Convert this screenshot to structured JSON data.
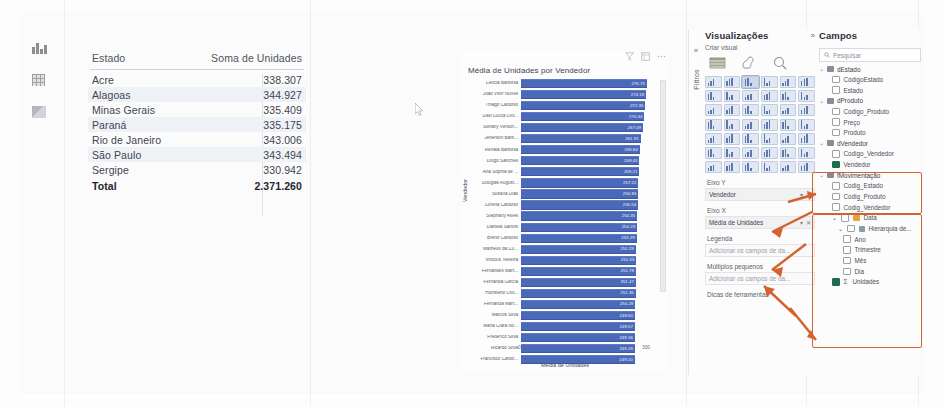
{
  "app": {
    "left_rail_icons": [
      "report-view-icon",
      "data-view-icon",
      "model-view-icon"
    ]
  },
  "table_visual": {
    "columns": [
      "Estado",
      "Soma de Unidades"
    ],
    "rows": [
      {
        "estado": "Acre",
        "valor": "338.307"
      },
      {
        "estado": "Alagoas",
        "valor": "344.927"
      },
      {
        "estado": "Minas Gerais",
        "valor": "335.409"
      },
      {
        "estado": "Paraná",
        "valor": "335.175"
      },
      {
        "estado": "Rio de Janeiro",
        "valor": "343.006"
      },
      {
        "estado": "São Paulo",
        "valor": "343.494"
      },
      {
        "estado": "Sergipe",
        "valor": "330.942"
      }
    ],
    "total_label": "Total",
    "total_value": "2.371.260"
  },
  "chart_data": {
    "type": "bar",
    "orientation": "horizontal",
    "title": "Média de Unidades por Vendedor",
    "xlabel": "Média de Unidades",
    "ylabel": "Vendedor",
    "xlim": [
      0,
      300
    ],
    "xticks": [
      "0",
      "300"
    ],
    "grid": false,
    "legend": "none",
    "bar_color": "#4a69b8",
    "categories": [
      "Letícia Barbosa",
      "João Vitor Nunes",
      "Thiago Cardoso",
      "Davi Lucca Oliv...",
      "Stefany Venturi...",
      "Jefferson Barb...",
      "Renata Barbosa",
      "Diogo Sanches",
      "Ana Sophia de ...",
      "Douglas August...",
      "Susana Dias",
      "Lorena Cardoso",
      "Stephany Alves",
      "Daniela Santos",
      "Breno Cardoso",
      "Matheus da Cu...",
      "Vinicius Teixeira",
      "Fernandes Mart...",
      "Fernanda Garcia",
      "Humberto Oliv...",
      "Fernanda Mart...",
      "Marcos Silva",
      "Maria Clara No...",
      "Frederico Silva",
      "Ricardo Silva",
      "Francisco Cardo..."
    ],
    "values": [
      275.75,
      274.18,
      272.35,
      270.34,
      267.09,
      261.91,
      259.84,
      259.43,
      259.21,
      257.22,
      256.83,
      256.54,
      254.35,
      254.23,
      253.29,
      251.29,
      252.33,
      251.78,
      251.47,
      251.35,
      250.29,
      249.6,
      249.57,
      249.36,
      249.28,
      249.1
    ],
    "value_labels": [
      "275.75",
      "274.18",
      "272.35",
      "270.34",
      "267.09",
      "261.91",
      "259.84",
      "259.43",
      "259.21",
      "257.22",
      "256.83",
      "256.54",
      "254.35",
      "254.23",
      "253.29",
      "251.29",
      "252.33",
      "251.78",
      "251.47",
      "251.35",
      "250.29",
      "249.60",
      "249.57",
      "249.36",
      "249.28",
      "249.10"
    ],
    "header_icons": [
      "filter-icon",
      "focus-mode-icon",
      "more-options-icon"
    ]
  },
  "filters_pane": {
    "label": "Filtros",
    "collapse_icon": "chevron-left-icon"
  },
  "visualizations_pane": {
    "title": "Visualizações",
    "expand_icon": "chevron-right-icon",
    "subtitle": "Criar visual",
    "build_icons": [
      "build-visual-icon",
      "format-visual-icon",
      "analytics-icon"
    ],
    "wells": [
      {
        "label": "Eixo Y",
        "value": "Vendedor",
        "empty": false
      },
      {
        "label": "Eixo X",
        "value": "Média de Unidades",
        "empty": false
      },
      {
        "label": "Legenda",
        "value": "Adicionar os campos de da...",
        "empty": true
      },
      {
        "label": "Múltiplos pequenos",
        "value": "Adicionar os campos de da...",
        "empty": true
      },
      {
        "label": "Dicas de ferramentas",
        "value": "",
        "empty": true
      }
    ]
  },
  "fields_pane": {
    "title": "Campos",
    "search_placeholder": "Pesquisar",
    "search_icon": "search-icon",
    "tables": [
      {
        "name": "dEstado",
        "fields": [
          {
            "name": "CódigoEstado",
            "checked": false,
            "kind": "field"
          },
          {
            "name": "Estado",
            "checked": false,
            "kind": "field"
          }
        ]
      },
      {
        "name": "dProduto",
        "fields": [
          {
            "name": "Codigo_Produto",
            "checked": false,
            "kind": "field"
          },
          {
            "name": "Preço",
            "checked": false,
            "kind": "field"
          },
          {
            "name": "Produto",
            "checked": false,
            "kind": "field"
          }
        ]
      },
      {
        "name": "dVendedor",
        "fields": [
          {
            "name": "Codigo_Vendedor",
            "checked": false,
            "kind": "field"
          },
          {
            "name": "Vendedor",
            "checked": true,
            "kind": "field"
          }
        ]
      },
      {
        "name": "fMovimentação",
        "fields": [
          {
            "name": "Codig_Estado",
            "checked": false,
            "kind": "field"
          },
          {
            "name": "Codig_Produto",
            "checked": false,
            "kind": "field"
          },
          {
            "name": "Codig_Vendedor",
            "checked": false,
            "kind": "field"
          },
          {
            "name": "Data",
            "checked": false,
            "kind": "date"
          },
          {
            "name": "Hierarquia de...",
            "checked": false,
            "kind": "hierarchy"
          },
          {
            "name": "Ano",
            "checked": false,
            "kind": "child"
          },
          {
            "name": "Trimestre",
            "checked": false,
            "kind": "child"
          },
          {
            "name": "Mês",
            "checked": false,
            "kind": "child"
          },
          {
            "name": "Dia",
            "checked": false,
            "kind": "child"
          },
          {
            "name": "Unidades",
            "checked": true,
            "kind": "measure",
            "sigma": "Σ"
          }
        ]
      }
    ]
  },
  "annotations": {
    "color": "#d4622c",
    "boxes": [
      "dvendedor-highlight",
      "fmovimentacao-highlight"
    ],
    "arrows": [
      "arrow-to-eixo-y",
      "arrow-to-eixo-x",
      "arrow-to-legenda",
      "arrow-to-vendedor-field",
      "arrow-to-unidades-field"
    ]
  }
}
